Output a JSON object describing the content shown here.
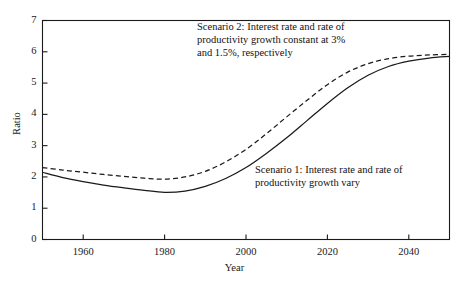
{
  "chart_data": {
    "type": "line",
    "title": "",
    "xlabel": "Year",
    "ylabel": "Ratio",
    "xlim": [
      1950,
      2050
    ],
    "ylim": [
      0,
      7
    ],
    "grid": false,
    "legend": "annotations-inline",
    "xticks": [
      1960,
      1980,
      2000,
      2020,
      2040
    ],
    "yticks": [
      0,
      1,
      2,
      3,
      4,
      5,
      6,
      7
    ],
    "annotations": [
      {
        "name": "scenario-2-annotation",
        "text": "Scenario 2: Interest rate and rate of\nproductivity growth constant at 3%\nand 1.5%, respectively",
        "x": 1990,
        "y": 6.6
      },
      {
        "name": "scenario-1-annotation",
        "text": "Scenario 1: Interest rate and rate of\nproductivity growth vary",
        "x": 2003,
        "y": 2.45
      }
    ],
    "series": [
      {
        "name": "Scenario 1: Interest rate and rate of productivity growth vary",
        "short_name": "Scenario 1",
        "style": "solid",
        "color": "#1a1a1a",
        "x": [
          1950,
          1955,
          1960,
          1965,
          1970,
          1975,
          1980,
          1985,
          1990,
          1995,
          2000,
          2005,
          2010,
          2015,
          2020,
          2025,
          2030,
          2035,
          2040,
          2045,
          2050
        ],
        "y": [
          2.15,
          1.98,
          1.85,
          1.74,
          1.65,
          1.57,
          1.51,
          1.55,
          1.7,
          1.95,
          2.3,
          2.75,
          3.25,
          3.8,
          4.35,
          4.85,
          5.25,
          5.53,
          5.7,
          5.8,
          5.85
        ]
      },
      {
        "name": "Scenario 2: Interest rate and rate of productivity growth constant at 3% and 1.5%, respectively",
        "short_name": "Scenario 2",
        "style": "dashed",
        "color": "#1a1a1a",
        "x": [
          1950,
          1955,
          1960,
          1965,
          1970,
          1975,
          1980,
          1985,
          1990,
          1995,
          2000,
          2005,
          2010,
          2015,
          2020,
          2025,
          2030,
          2035,
          2040,
          2045,
          2050
        ],
        "y": [
          2.3,
          2.22,
          2.15,
          2.08,
          2.02,
          1.96,
          1.93,
          2.0,
          2.18,
          2.48,
          2.88,
          3.38,
          3.92,
          4.45,
          4.95,
          5.35,
          5.62,
          5.78,
          5.86,
          5.9,
          5.92
        ]
      }
    ]
  },
  "axis": {
    "y_label": "Ratio",
    "x_label": "Year",
    "y_tick_labels": [
      "7",
      "6",
      "5",
      "4",
      "3",
      "2",
      "1",
      "0"
    ],
    "x_tick_labels": [
      "1960",
      "1980",
      "2000",
      "2020",
      "2040"
    ]
  },
  "annotations": {
    "scenario2": "Scenario 2: Interest rate and rate of\nproductivity growth constant at 3%\nand 1.5%, respectively",
    "scenario1": "Scenario 1: Interest rate and rate of\nproductivity growth vary"
  },
  "colors": {
    "line": "#1a1a1a",
    "frame": "#1a1a1a",
    "background": "#ffffff"
  }
}
